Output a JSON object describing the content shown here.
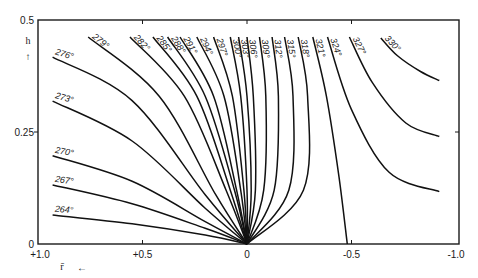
{
  "chart_data": {
    "type": "line",
    "title": "",
    "xlabel": "r̄",
    "ylabel": "h",
    "xlim": [
      1.0,
      -1.0
    ],
    "ylim": [
      0,
      0.5
    ],
    "x_direction": "decreasing-to-right",
    "grid": false,
    "x_ticks": [
      {
        "value": 1.0,
        "label": "+1.0"
      },
      {
        "value": 0.5,
        "label": "+0.5"
      },
      {
        "value": 0.0,
        "label": "0"
      },
      {
        "value": -0.5,
        "label": "-0.5"
      },
      {
        "value": -1.0,
        "label": "-1.0"
      }
    ],
    "y_ticks": [
      {
        "value": 0,
        "label": "0"
      },
      {
        "value": 0.25,
        "label": "0.25"
      },
      {
        "value": 0.5,
        "label": "0.5"
      }
    ],
    "x_arrow": "←",
    "y_arrow": "↑",
    "series": [
      {
        "name": "264°",
        "points": [
          [
            0.93,
            0.065
          ],
          [
            0.55,
            0.045
          ],
          [
            0.2,
            0.02
          ],
          [
            0.0,
            0.0
          ]
        ]
      },
      {
        "name": "267°",
        "points": [
          [
            0.93,
            0.132
          ],
          [
            0.55,
            0.09
          ],
          [
            0.2,
            0.035
          ],
          [
            0.0,
            0.0
          ]
        ]
      },
      {
        "name": "270°",
        "points": [
          [
            0.93,
            0.197
          ],
          [
            0.55,
            0.14
          ],
          [
            0.2,
            0.05
          ],
          [
            0.0,
            0.0
          ]
        ]
      },
      {
        "name": "273°",
        "points": [
          [
            0.93,
            0.319
          ],
          [
            0.55,
            0.23
          ],
          [
            0.2,
            0.08
          ],
          [
            0.0,
            0.0
          ]
        ]
      },
      {
        "name": "276°",
        "points": [
          [
            0.93,
            0.417
          ],
          [
            0.55,
            0.32
          ],
          [
            0.2,
            0.11
          ],
          [
            0.0,
            0.0
          ]
        ]
      },
      {
        "name": "279°",
        "points": [
          [
            0.76,
            0.462
          ],
          [
            0.42,
            0.33
          ],
          [
            0.15,
            0.11
          ],
          [
            0.0,
            0.0
          ]
        ]
      },
      {
        "name": "282°",
        "points": [
          [
            0.56,
            0.462
          ],
          [
            0.3,
            0.33
          ],
          [
            0.1,
            0.12
          ],
          [
            0.0,
            0.0
          ]
        ]
      },
      {
        "name": "285°",
        "points": [
          [
            0.45,
            0.462
          ],
          [
            0.24,
            0.33
          ],
          [
            0.08,
            0.12
          ],
          [
            0.0,
            0.0
          ]
        ]
      },
      {
        "name": "288°",
        "points": [
          [
            0.38,
            0.462
          ],
          [
            0.2,
            0.33
          ],
          [
            0.06,
            0.12
          ],
          [
            0.0,
            0.0
          ]
        ]
      },
      {
        "name": "291°",
        "points": [
          [
            0.32,
            0.462
          ],
          [
            0.16,
            0.33
          ],
          [
            0.05,
            0.12
          ],
          [
            0.0,
            0.0
          ]
        ]
      },
      {
        "name": "294°",
        "points": [
          [
            0.24,
            0.462
          ],
          [
            0.11,
            0.33
          ],
          [
            0.03,
            0.12
          ],
          [
            0.0,
            0.0
          ]
        ]
      },
      {
        "name": "297°",
        "points": [
          [
            0.16,
            0.462
          ],
          [
            0.07,
            0.33
          ],
          [
            0.015,
            0.12
          ],
          [
            0.0,
            0.0
          ]
        ]
      },
      {
        "name": "300°",
        "points": [
          [
            0.08,
            0.462
          ],
          [
            0.03,
            0.33
          ],
          [
            0.0,
            0.12
          ],
          [
            0.0,
            0.0
          ]
        ]
      },
      {
        "name": "303°",
        "points": [
          [
            0.04,
            0.462
          ],
          [
            0.0,
            0.33
          ],
          [
            -0.02,
            0.12
          ],
          [
            0.0,
            0.0
          ]
        ]
      },
      {
        "name": "306°",
        "points": [
          [
            0.0,
            0.462
          ],
          [
            -0.03,
            0.33
          ],
          [
            -0.04,
            0.12
          ],
          [
            0.0,
            0.0
          ]
        ]
      },
      {
        "name": "309°",
        "points": [
          [
            -0.06,
            0.462
          ],
          [
            -0.09,
            0.33
          ],
          [
            -0.08,
            0.12
          ],
          [
            0.0,
            0.0
          ]
        ]
      },
      {
        "name": "312°",
        "points": [
          [
            -0.12,
            0.462
          ],
          [
            -0.15,
            0.33
          ],
          [
            -0.13,
            0.12
          ],
          [
            0.0,
            0.0
          ]
        ]
      },
      {
        "name": "315°",
        "points": [
          [
            -0.18,
            0.462
          ],
          [
            -0.22,
            0.33
          ],
          [
            -0.2,
            0.12
          ],
          [
            0.0,
            0.0
          ]
        ]
      },
      {
        "name": "318°",
        "points": [
          [
            -0.245,
            0.462
          ],
          [
            -0.29,
            0.33
          ],
          [
            -0.27,
            0.12
          ],
          [
            0.0,
            0.0
          ]
        ]
      },
      {
        "name": "321°",
        "points": [
          [
            -0.315,
            0.462
          ],
          [
            -0.38,
            0.33
          ],
          [
            -0.44,
            0.15
          ],
          [
            -0.48,
            0.0
          ]
        ]
      },
      {
        "name": "324°",
        "points": [
          [
            -0.385,
            0.462
          ],
          [
            -0.5,
            0.3
          ],
          [
            -0.68,
            0.16
          ],
          [
            -0.92,
            0.117
          ]
        ]
      },
      {
        "name": "327°",
        "points": [
          [
            -0.49,
            0.462
          ],
          [
            -0.6,
            0.36
          ],
          [
            -0.76,
            0.27
          ],
          [
            -0.92,
            0.24
          ]
        ]
      },
      {
        "name": "330°",
        "points": [
          [
            -0.64,
            0.46
          ],
          [
            -0.72,
            0.42
          ],
          [
            -0.83,
            0.385
          ],
          [
            -0.92,
            0.365
          ]
        ]
      }
    ]
  }
}
